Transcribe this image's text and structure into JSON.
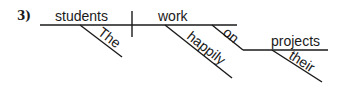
{
  "problem": {
    "number": "3)"
  },
  "diagram": {
    "type": "sentence-diagram",
    "sentence": "The students work happily on their projects",
    "subject": "students",
    "verb": "work",
    "modifiers": {
      "subject_article": "The",
      "verb_adverb": "happily",
      "preposition": "on",
      "object_of_preposition": "projects",
      "object_modifier": "their"
    }
  },
  "colors": {
    "ink": "#1a1a1a",
    "background": "#ffffff"
  }
}
